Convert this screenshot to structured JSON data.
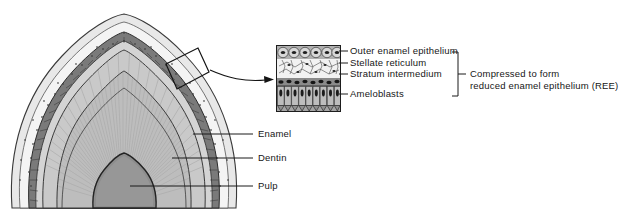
{
  "figure": {
    "type": "histology-diagram"
  },
  "tooth_labels": [
    {
      "id": "enamel",
      "text": "Enamel",
      "x": 258,
      "y": 130,
      "leader_x1": 193,
      "leader_x2": 253,
      "leader_y": 134
    },
    {
      "id": "dentin",
      "text": "Dentin",
      "x": 258,
      "y": 154,
      "leader_x1": 172,
      "leader_x2": 253,
      "leader_y": 158
    },
    {
      "id": "pulp",
      "text": "Pulp",
      "x": 258,
      "y": 182,
      "leader_x1": 130,
      "leader_x2": 253,
      "leader_y": 186
    }
  ],
  "inset_labels": [
    {
      "id": "outer-enamel-epithelium",
      "text": "Outer enamel epithelium",
      "y": 49
    },
    {
      "id": "stellate-reticulum",
      "text": "Stellate reticulum",
      "y": 61
    },
    {
      "id": "stratum-intermedium",
      "text": "Stratum intermedium",
      "y": 72
    },
    {
      "id": "ameloblasts",
      "text": "Ameloblasts",
      "y": 92
    }
  ],
  "bracket_note": {
    "line1": "Compressed to form",
    "line2": "reduced enamel epithelium (REE)"
  },
  "colors": {
    "ink": "#1a1a1a",
    "enamel_fill": "#c9c9c9",
    "dentin_fill": "#bdbdbd",
    "pulp_fill": "#8d8d8d",
    "epithelium_fill": "#9a9a9a",
    "background": "#ffffff"
  },
  "icons": {
    "callout_arrow": "curved-arrow-icon",
    "callout_box": "magnify-region-box-icon",
    "bracket": "brace-bracket-icon"
  }
}
